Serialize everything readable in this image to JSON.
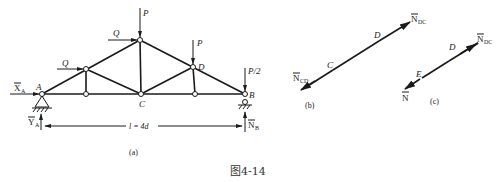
{
  "figure": {
    "caption": "图4-14",
    "subfigures": [
      {
        "id": "a",
        "label": "(a)"
      },
      {
        "id": "b",
        "label": "(b)"
      },
      {
        "id": "c",
        "label": "(c)"
      }
    ]
  },
  "truss": {
    "nodes": {
      "A": "A",
      "B": "B",
      "C": "C",
      "D": "D"
    },
    "loads": {
      "P_top": "P",
      "P_D": "P",
      "P_half": "P/2",
      "Q_upper": "Q",
      "Q_lower": "Q"
    },
    "reactions": {
      "XA_main": "X",
      "XA_sub": "A",
      "YA_main": "Y",
      "YA_sub": "A",
      "NB_main": "N",
      "NB_sub": "B"
    },
    "span": "l = 4d"
  },
  "fig_b": {
    "node_C": "C",
    "node_D": "D",
    "force_left_main": "N",
    "force_left_sub": "CD",
    "force_right_main": "N",
    "force_right_sub": "DC"
  },
  "fig_c": {
    "node_E": "E",
    "node_D": "D",
    "force_left": "N",
    "force_right_main": "N",
    "force_right_sub": "DC"
  }
}
